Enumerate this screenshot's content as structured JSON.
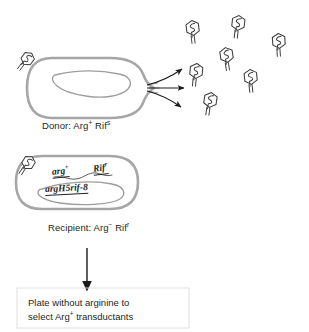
{
  "figure": {
    "donor": {
      "label_prefix": "Donor: Arg",
      "label_sup1": "+",
      "label_mid": " Rif",
      "label_sup2": "s",
      "full_label": "Donor: Arg+ Rifs",
      "cell_shape": "rod-capsule",
      "chromosome": "curved-loop"
    },
    "recipient": {
      "label_prefix": "Recipient: Arg",
      "label_sup1": "−",
      "label_mid": " Rif",
      "label_sup2": "r",
      "full_label": "Recipient: Arg− Rifr",
      "genes": {
        "arg_text": "arg",
        "arg_sup": "+",
        "rif_text": "Rif",
        "rif_sup": "r",
        "locus_text": "argH5rif-8"
      }
    },
    "phage": {
      "icon_name": "bacteriophage-icon",
      "count_released": 8,
      "attached_count": 2,
      "description": "hexagonal head with DNA squiggle and tail fibers"
    },
    "arrows": {
      "burst_arrow_count": 3,
      "down_arrow_label": "flow-to-plating-step"
    },
    "caption": {
      "line1": "Plate without arginine to",
      "line2_prefix": "select Arg",
      "line2_sup": "+",
      "line2_suffix": " transductants",
      "full": "Plate without arginine to select Arg+ transductants"
    },
    "colors": {
      "outline": "#231f20",
      "cell_membrane": "#9a9a9a",
      "chromosome": "#8c8c8c",
      "background": "#ffffff",
      "text": "#231f20"
    }
  }
}
